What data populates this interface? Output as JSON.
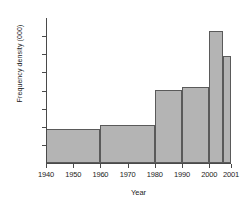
{
  "chart_data": {
    "type": "bar",
    "title": "",
    "xlabel": "Year",
    "ylabel": "Frequency density (000)",
    "grid": false,
    "legend": "none",
    "xlim": [
      1940,
      2001
    ],
    "ylim": [
      0,
      8
    ],
    "x_tick_labels": [
      "1940",
      "1950",
      "1960",
      "1970",
      "1980",
      "1990",
      "2000",
      "2001"
    ],
    "x_tick_values": [
      1940,
      1950,
      1960,
      1970,
      1980,
      1990,
      2000,
      2001
    ],
    "y_tick_values": [
      0,
      1,
      2,
      3,
      4,
      5,
      6,
      7
    ],
    "y_tick_labels": [
      "",
      "",
      "",
      "",
      "",
      "",
      "",
      ""
    ],
    "bin_edges": [
      1940,
      1960,
      1980,
      1990,
      2000,
      2005,
      2008
    ],
    "categories": [
      "1940-1960",
      "1960-1980",
      "1980-1990",
      "1990-2000",
      "2000-2005",
      "2005-2001"
    ],
    "values": [
      1.9,
      2.1,
      4.05,
      4.2,
      7.3,
      5.9
    ],
    "bars": [
      {
        "label": "1940-1960",
        "x_start": 1940,
        "x_end": 1960,
        "value": 1.9
      },
      {
        "label": "1960-1980",
        "x_start": 1960,
        "x_end": 1980,
        "value": 2.1
      },
      {
        "label": "1980-1990",
        "x_start": 1980,
        "x_end": 1990,
        "value": 4.05
      },
      {
        "label": "1990-2000",
        "x_start": 1990,
        "x_end": 2000,
        "value": 4.2
      },
      {
        "label": "2000-2005",
        "x_start": 2000,
        "x_end": 2005,
        "value": 7.3
      },
      {
        "label": "2005-2001",
        "x_start": 2005,
        "x_end": 2008,
        "value": 5.9
      }
    ],
    "bar_color": "#b4b4b4",
    "bar_edge_color": "#5a5a5a",
    "axis_color": "#4a4a4a"
  }
}
